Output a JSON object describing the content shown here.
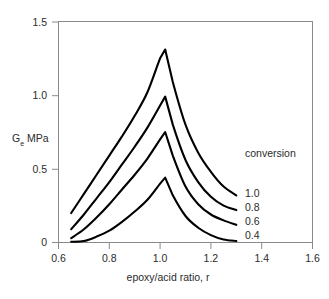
{
  "chart_data": {
    "type": "line",
    "title": "",
    "xlabel": "epoxy/acid ratio, r",
    "ylabel_main": "G",
    "ylabel_sub": "e",
    "ylabel_unit": " MPa",
    "ylabel_full": "Ge MPa",
    "xlim": [
      0.6,
      1.6
    ],
    "ylim": [
      0.0,
      1.5
    ],
    "xticks": [
      0.6,
      0.8,
      1.0,
      1.2,
      1.4,
      1.6
    ],
    "xtick_labels": [
      "0.6",
      "0.8",
      "1.0",
      "1.2",
      "1.4",
      "1.6"
    ],
    "yticks": [
      0.0,
      0.5,
      1.0,
      1.5
    ],
    "ytick_labels": [
      "0",
      "0.5",
      "1.0",
      "1.5"
    ],
    "grid": false,
    "legend_position": "right-inside",
    "legend_title": "conversion",
    "line_color": "#000000",
    "frame_color": "#8a8a8a",
    "background_color": "#ffffff",
    "peak_x": 1.02,
    "series": [
      {
        "name": "1.0",
        "conversion": 1.0,
        "peak_value": 1.31,
        "x": [
          0.65,
          0.7,
          0.75,
          0.8,
          0.85,
          0.9,
          0.95,
          1.0,
          1.02,
          1.05,
          1.1,
          1.15,
          1.2,
          1.25,
          1.3
        ],
        "values": [
          0.2,
          0.33,
          0.46,
          0.59,
          0.72,
          0.86,
          1.02,
          1.25,
          1.31,
          1.09,
          0.8,
          0.61,
          0.48,
          0.38,
          0.32
        ]
      },
      {
        "name": "0.8",
        "conversion": 0.8,
        "peak_value": 0.99,
        "x": [
          0.65,
          0.7,
          0.75,
          0.8,
          0.85,
          0.9,
          0.95,
          1.0,
          1.02,
          1.05,
          1.1,
          1.15,
          1.2,
          1.25,
          1.3
        ],
        "values": [
          0.09,
          0.19,
          0.3,
          0.41,
          0.53,
          0.65,
          0.78,
          0.93,
          0.99,
          0.8,
          0.56,
          0.41,
          0.31,
          0.25,
          0.22
        ]
      },
      {
        "name": "0.6",
        "conversion": 0.6,
        "peak_value": 0.75,
        "x": [
          0.65,
          0.7,
          0.75,
          0.8,
          0.85,
          0.9,
          0.95,
          1.0,
          1.02,
          1.05,
          1.1,
          1.15,
          1.2,
          1.25,
          1.3
        ],
        "values": [
          0.03,
          0.09,
          0.17,
          0.26,
          0.36,
          0.46,
          0.57,
          0.7,
          0.75,
          0.59,
          0.38,
          0.26,
          0.19,
          0.15,
          0.12
        ]
      },
      {
        "name": "0.4",
        "conversion": 0.4,
        "peak_value": 0.44,
        "x": [
          0.65,
          0.7,
          0.75,
          0.8,
          0.85,
          0.9,
          0.95,
          1.0,
          1.02,
          1.05,
          1.1,
          1.15,
          1.2,
          1.25,
          1.3
        ],
        "values": [
          0.005,
          0.01,
          0.04,
          0.08,
          0.14,
          0.21,
          0.29,
          0.4,
          0.44,
          0.32,
          0.18,
          0.1,
          0.05,
          0.02,
          0.01
        ]
      }
    ],
    "legend_entries": [
      "1.0",
      "0.8",
      "0.6",
      "0.4"
    ]
  }
}
